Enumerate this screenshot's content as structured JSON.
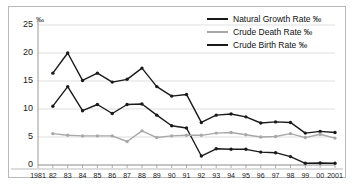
{
  "chart_data": {
    "type": "line",
    "title": "",
    "xlabel": "",
    "ylabel": "",
    "unit_label": "‰",
    "ylim": [
      0,
      25
    ],
    "yticks": [
      0,
      5,
      10,
      15,
      20,
      25
    ],
    "grid": true,
    "legend_position": "top-right",
    "x": [
      1981,
      1982,
      1983,
      1984,
      1985,
      1986,
      1987,
      1988,
      1989,
      1990,
      1991,
      1992,
      1993,
      1994,
      1995,
      1996,
      1997,
      1998,
      1999,
      2000,
      2001
    ],
    "categories": [
      "1981",
      "82",
      "83",
      "84",
      "85",
      "86",
      "87",
      "88",
      "89",
      "90",
      "91",
      "92",
      "93",
      "94",
      "95",
      "96",
      "97",
      "98",
      "99",
      "00",
      "2001"
    ],
    "series": [
      {
        "name": "Crude Birth Rate ‰",
        "color": "#1a1a1a",
        "values": [
          null,
          16.4,
          20.0,
          15.1,
          16.4,
          14.8,
          15.3,
          17.3,
          14.0,
          12.3,
          12.6,
          7.6,
          8.9,
          9.1,
          8.6,
          7.5,
          7.7,
          7.6,
          5.7,
          6.0,
          5.8
        ]
      },
      {
        "name": "Natural Growth Rate ‰",
        "color": "#1a1a1a",
        "values": [
          null,
          10.5,
          14.0,
          9.7,
          10.8,
          9.2,
          10.8,
          10.9,
          8.9,
          7.0,
          6.6,
          1.6,
          2.9,
          2.8,
          2.8,
          2.3,
          2.2,
          1.5,
          0.3,
          0.35,
          0.3
        ]
      },
      {
        "name": "Crude Death Rate ‰",
        "color": "#a8a8a8",
        "values": [
          null,
          5.6,
          5.3,
          5.2,
          5.2,
          5.2,
          4.2,
          6.1,
          4.9,
          5.2,
          5.3,
          5.3,
          5.7,
          5.8,
          5.4,
          5.0,
          5.1,
          5.6,
          4.9,
          5.5,
          4.8
        ]
      }
    ],
    "legend": [
      {
        "label": "Natural Growth Rate ‰",
        "color": "#1a1a1a"
      },
      {
        "label": "Crude Death Rate ‰",
        "color": "#a8a8a8"
      },
      {
        "label": "Crude Birth Rate ‰",
        "color": "#1a1a1a"
      }
    ]
  }
}
